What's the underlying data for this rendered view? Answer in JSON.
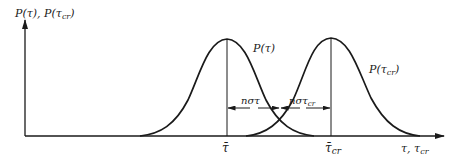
{
  "figure": {
    "y_axis_label": "P(τ), P(τcr)",
    "x_axis_label": "τ, τcr",
    "curves": [
      {
        "name": "P(τ)",
        "label": "P(τ)",
        "mean_label": "τ̄",
        "peak_x": 227
      },
      {
        "name": "P(τcr)",
        "label": "P(τcr)",
        "mean_label": "τ̄cr",
        "peak_x": 331
      }
    ],
    "dimensions": [
      {
        "label": "nστ",
        "from": "τ̄",
        "to": "crossing"
      },
      {
        "label": "nστcr",
        "from": "crossing",
        "to": "τ̄cr"
      }
    ],
    "tick_labels": {
      "tau_mean": "τ̄",
      "tau_cr_mean_base": "τ̄",
      "tau_cr_mean_sub": "cr"
    },
    "text": {
      "y_label_a": "P(",
      "y_label_tau": "τ",
      "y_label_b": "), P(",
      "y_label_c": "τ",
      "y_label_sub": "cr",
      "y_label_d": ")",
      "curve1_label": "P(τ)",
      "curve2_label_base": "P(τ",
      "curve2_label_sub": "cr",
      "curve2_label_end": ")",
      "dim1_base": "nστ",
      "dim2_base": "nστ",
      "dim2_sub": "cr",
      "xlabel_base": "τ, τ",
      "xlabel_sub": "cr"
    },
    "colors": {
      "ink": "#1a1a1a",
      "background": "#ffffff"
    }
  }
}
